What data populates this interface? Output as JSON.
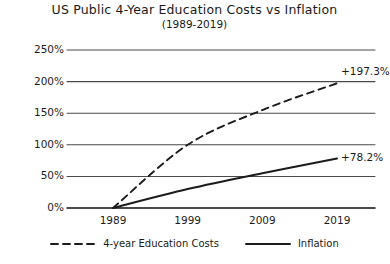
{
  "chart_data": {
    "type": "line",
    "title": "US Public 4-Year Education Costs vs Inflation",
    "subtitle": "(1989-2019)",
    "xlabel": "",
    "ylabel": "",
    "x": [
      1989,
      1999,
      2009,
      2019
    ],
    "categories": [
      "1989",
      "1999",
      "2009",
      "2019"
    ],
    "xlim": [
      1989,
      2019
    ],
    "ylim": [
      0,
      250
    ],
    "ytick_labels": [
      "0%",
      "50%",
      "100%",
      "150%",
      "200%",
      "250%"
    ],
    "ytick_values": [
      0,
      50,
      100,
      150,
      200,
      250
    ],
    "grid": "horizontal",
    "legend_position": "bottom",
    "series": [
      {
        "name": "4-year Education Costs",
        "style": "dashed",
        "color": "#1b1b1b",
        "values": [
          0,
          100,
          155,
          197.3
        ],
        "end_label": "+197.3%"
      },
      {
        "name": "Inflation",
        "style": "solid",
        "color": "#1b1b1b",
        "values": [
          0,
          30,
          55,
          78.2
        ],
        "end_label": "+78.2%"
      }
    ]
  },
  "legend": {
    "items": [
      {
        "label": "4-year Education Costs",
        "style": "dashed"
      },
      {
        "label": "Inflation",
        "style": "solid"
      }
    ]
  }
}
